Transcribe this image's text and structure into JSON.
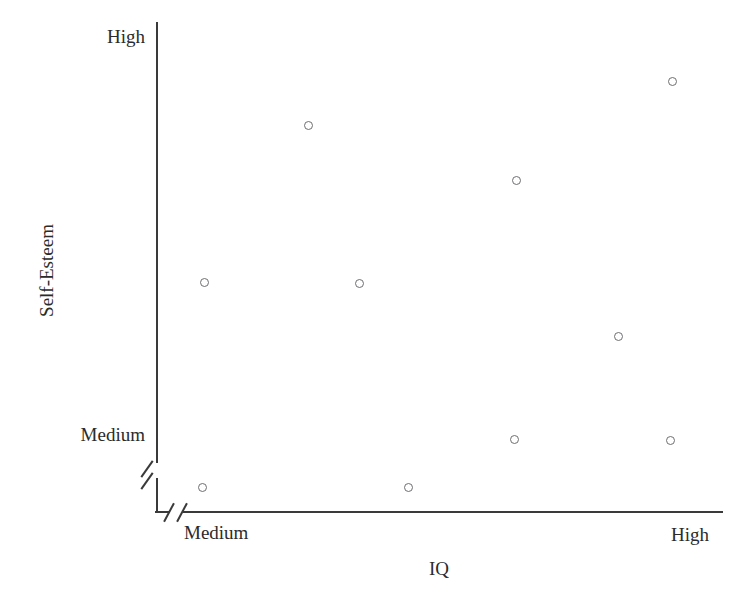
{
  "chart_data": {
    "type": "scatter",
    "title": "",
    "xlabel": "IQ",
    "ylabel": "Self-Esteem",
    "x_tick_labels": [
      "Medium",
      "High"
    ],
    "y_tick_labels": [
      "Medium",
      "High"
    ],
    "x_axis_break": true,
    "y_axis_break": true,
    "grid": false,
    "legend": null,
    "marker": "open-circle",
    "marker_color": "#6e6e72",
    "axis_color": "#3a3a3a",
    "background": "#ffffff",
    "n_points": 10,
    "x_pixel_range": [
      155,
      722
    ],
    "y_pixel_range": [
      22,
      511
    ],
    "points_pixels": [
      {
        "px": 672,
        "py": 81
      },
      {
        "px": 308,
        "py": 125
      },
      {
        "px": 516,
        "py": 180
      },
      {
        "px": 204,
        "py": 282
      },
      {
        "px": 359,
        "py": 283
      },
      {
        "px": 618,
        "py": 336
      },
      {
        "px": 514,
        "py": 439
      },
      {
        "px": 670,
        "py": 440
      },
      {
        "px": 202,
        "py": 487
      },
      {
        "px": 408,
        "py": 487
      }
    ],
    "points_normalized": [
      {
        "x": 0.912,
        "y": 0.879
      },
      {
        "x": 0.27,
        "y": 0.789
      },
      {
        "x": 0.637,
        "y": 0.677
      },
      {
        "x": 0.086,
        "y": 0.468
      },
      {
        "x": 0.36,
        "y": 0.466
      },
      {
        "x": 0.817,
        "y": 0.358
      },
      {
        "x": 0.633,
        "y": 0.147
      },
      {
        "x": 0.908,
        "y": 0.145
      },
      {
        "x": 0.083,
        "y": 0.049
      },
      {
        "x": 0.446,
        "y": 0.049
      }
    ]
  },
  "axes": {
    "y": {
      "title": "Self-Esteem",
      "ticks": [
        {
          "label": "High",
          "pixel_y": 36
        },
        {
          "label": "Medium",
          "pixel_y": 434
        }
      ]
    },
    "x": {
      "title": "IQ",
      "ticks": [
        {
          "label": "Medium",
          "pixel_x": 184
        },
        {
          "label": "High",
          "pixel_x": 671
        }
      ]
    }
  }
}
